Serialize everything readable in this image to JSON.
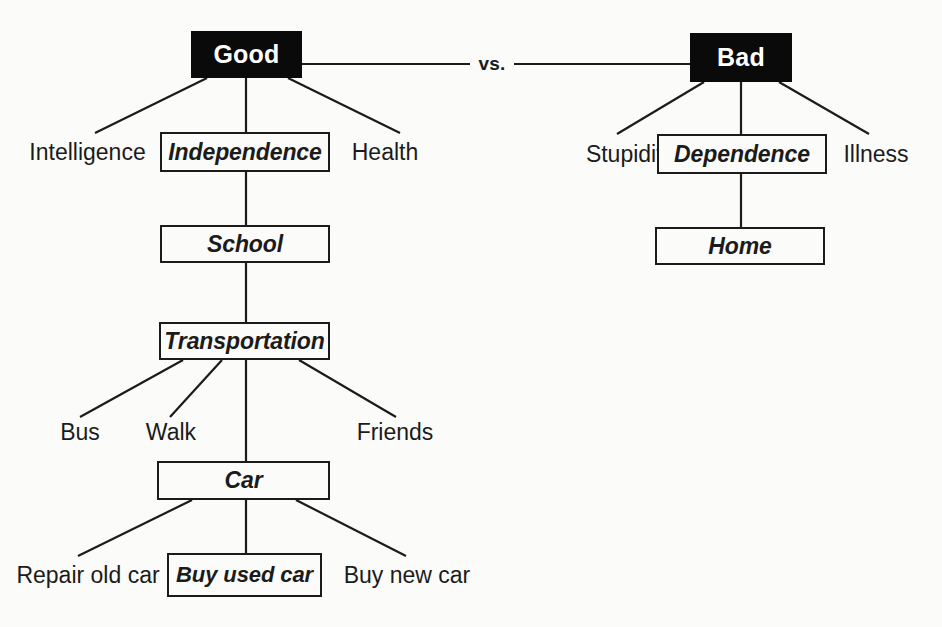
{
  "diagram": {
    "background_color": "#fbfbfa",
    "line_color": "#1b1b1b",
    "root_fill_color": "#0a0a0a",
    "root_text_color": "#ffffff",
    "comparator_label": "vs.",
    "nodes": {
      "good": "Good",
      "bad": "Bad",
      "intelligence": "Intelligence",
      "independence": "Independence",
      "health": "Health",
      "stupidity": "Stupidity",
      "dependence": "Dependence",
      "illness": "Illness",
      "school": "School",
      "home": "Home",
      "transportation": "Transportation",
      "bus": "Bus",
      "walk": "Walk",
      "friends": "Friends",
      "car": "Car",
      "repair_old_car": "Repair old car",
      "buy_used_car": "Buy used car",
      "buy_new_car": "Buy new car"
    }
  }
}
